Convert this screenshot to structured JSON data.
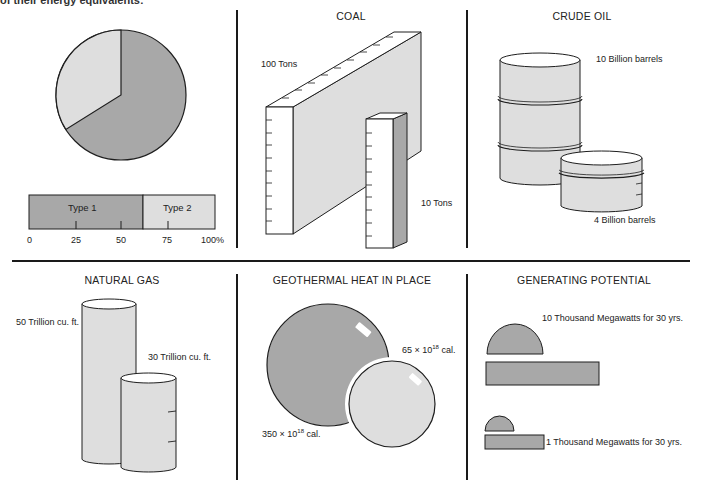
{
  "caption": "of their energy equivalents:",
  "colors": {
    "dark_fill": "#a8a8a8",
    "light_fill": "#dedede",
    "stroke": "#1e1e1e",
    "white": "#ffffff"
  },
  "panels": {
    "pie_bar": {
      "legend": [
        {
          "label": "Type 1",
          "percent": 62,
          "color": "#a8a8a8"
        },
        {
          "label": "Type 2",
          "percent": 38,
          "color": "#dedede"
        }
      ],
      "axis_ticks": [
        "0",
        "25",
        "50",
        "75",
        "100%"
      ]
    },
    "coal": {
      "title": "COAL",
      "large_label": "100 Tons",
      "small_label": "10 Tons"
    },
    "crude_oil": {
      "title": "CRUDE OIL",
      "large_label": "10 Billion barrels",
      "small_label": "4 Billion barrels"
    },
    "natural_gas": {
      "title": "NATURAL GAS",
      "large_label": "50 Trillion cu. ft.",
      "small_label": "30 Trillion cu. ft."
    },
    "geothermal": {
      "title": "GEOTHERMAL HEAT IN PLACE",
      "large_label_prefix": "350 × 10",
      "large_label_exp": "18",
      "large_label_suffix": " cal.",
      "small_label_prefix": "65 × 10",
      "small_label_exp": "18",
      "small_label_suffix": " cal."
    },
    "generating_potential": {
      "title": "GENERATING POTENTIAL",
      "large_label": "10 Thousand Megawatts for 30 yrs.",
      "small_label": "1 Thousand Megawatts for 30 yrs."
    }
  },
  "chart_data": {
    "type": "pie",
    "title": "",
    "categories": [
      "Type 1",
      "Type 2"
    ],
    "values": [
      62,
      38
    ],
    "bar_axis": {
      "ticks": [
        0,
        25,
        50,
        75,
        100
      ],
      "unit": "%"
    },
    "comparisons": [
      {
        "resource": "COAL",
        "large": "100 Tons",
        "small": "10 Tons"
      },
      {
        "resource": "CRUDE OIL",
        "large": "10 Billion barrels",
        "small": "4 Billion barrels"
      },
      {
        "resource": "NATURAL GAS",
        "large": "50 Trillion cu. ft.",
        "small": "30 Trillion cu. ft."
      },
      {
        "resource": "GEOTHERMAL HEAT IN PLACE",
        "large": "350 × 10^18 cal.",
        "small": "65 × 10^18 cal."
      },
      {
        "resource": "GENERATING POTENTIAL",
        "large": "10 Thousand Megawatts for 30 yrs.",
        "small": "1 Thousand Megawatts for 30 yrs."
      }
    ]
  }
}
